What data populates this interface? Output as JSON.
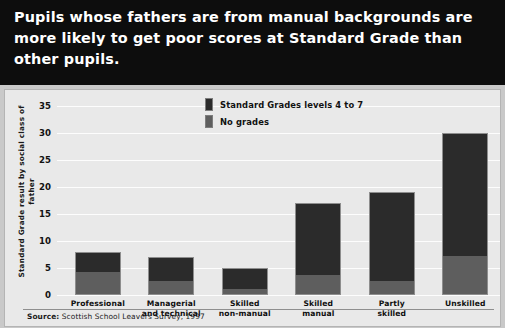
{
  "title": {
    "text": "Pupils whose fathers are from manual backgrounds are more likely to get poor scores at Standard Grade than other pupils."
  },
  "legend": {
    "items": [
      {
        "label": "Standard Grades levels 4 to 7",
        "color": "#2b2b2b",
        "swatch": "dark-swatch-icon"
      },
      {
        "label": "No grades",
        "color": "#5e5e5e",
        "swatch": "gray-swatch-icon"
      }
    ]
  },
  "source": {
    "prefix": "Source:",
    "text": " Scottish School Leavers Survey, 1997"
  },
  "colors": {
    "banner_background": "#0d0d0d",
    "banner_text": "#ffffff",
    "plot_background": "#e9e9e9",
    "gridline": "#fdfdfd",
    "series_standard_grades": "#2b2b2b",
    "series_no_grades": "#5e5e5e",
    "frame": "#c9c9c9"
  },
  "chart_data": {
    "type": "bar",
    "subtype": "stacked-vertical",
    "title": "Pupils whose fathers are from manual backgrounds are more likely to get poor scores at Standard Grade than other pupils.",
    "xlabel": "",
    "ylabel": "Standard Grade result by social class of father",
    "ylim": [
      0,
      35
    ],
    "ytick_step": 5,
    "ytick_labels": [
      "35",
      "30",
      "25",
      "20",
      "15",
      "10",
      "5",
      "0"
    ],
    "ytick_values": [
      35,
      30,
      25,
      20,
      15,
      10,
      5,
      0
    ],
    "grid": true,
    "legend_position": "inside-top-center",
    "categories": [
      "Professional",
      "Managerial and technical",
      "Skilled non-manual",
      "Skilled manual",
      "Partly skilled",
      "Unskilled"
    ],
    "category_labels_wrapped": [
      [
        "Professional"
      ],
      [
        "Managerial",
        "and technical"
      ],
      [
        "Skilled",
        "non-manual"
      ],
      [
        "Skilled",
        "manual"
      ],
      [
        "Partly",
        "skilled"
      ],
      [
        "Unskilled"
      ]
    ],
    "series": [
      {
        "name": "No grades",
        "color": "#5e5e5e",
        "values": [
          4,
          2.5,
          1,
          3.5,
          2.5,
          7
        ]
      },
      {
        "name": "Standard Grades levels 4 to 7",
        "color": "#2b2b2b",
        "values": [
          4,
          4.5,
          4,
          13.5,
          16.5,
          23
        ]
      }
    ],
    "totals": [
      8,
      7,
      5,
      17,
      19,
      30
    ],
    "units": "per cent"
  }
}
